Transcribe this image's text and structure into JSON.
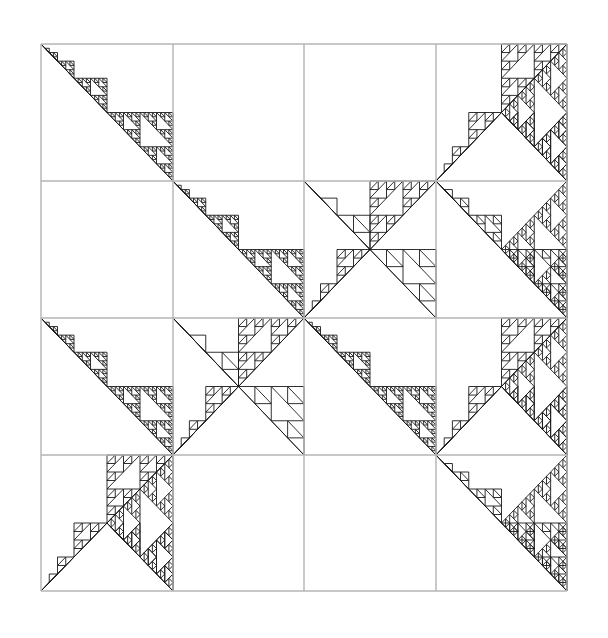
{
  "figure": {
    "type": "fractal-grid",
    "background": "#ffffff",
    "grid": {
      "rows": 4,
      "cols": 4,
      "x_lines": [
        41,
        173,
        304,
        436,
        567
      ],
      "y_lines": [
        44,
        181,
        318,
        455,
        591
      ],
      "line_color": "#b4b4b4",
      "line_width": 1.4
    },
    "fractal": {
      "stroke_color": "#1a1a1a",
      "stroke_width": 0.9,
      "depth": 5,
      "motifs": [
        {
          "cell": [
            0,
            0
          ],
          "kind": "down"
        },
        {
          "cell": [
            0,
            3
          ],
          "kind": "up-right-full"
        },
        {
          "cell": [
            1,
            1
          ],
          "kind": "down"
        },
        {
          "cell": [
            1,
            2
          ],
          "kind": "up-and-down"
        },
        {
          "cell": [
            1,
            3
          ],
          "kind": "right-down"
        },
        {
          "cell": [
            2,
            0
          ],
          "kind": "down"
        },
        {
          "cell": [
            2,
            1
          ],
          "kind": "up-and-down"
        },
        {
          "cell": [
            2,
            2
          ],
          "kind": "down"
        },
        {
          "cell": [
            2,
            3
          ],
          "kind": "up-right-full"
        },
        {
          "cell": [
            3,
            0
          ],
          "kind": "up-right-full"
        },
        {
          "cell": [
            3,
            3
          ],
          "kind": "right-down"
        }
      ]
    }
  }
}
